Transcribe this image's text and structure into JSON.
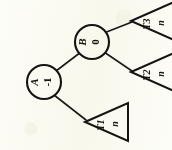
{
  "diagram": {
    "orientation": "rotated-90-ccw",
    "background_color": "#fdfdf8",
    "ink_color": "#141412",
    "nodes": [
      {
        "id": "A",
        "label": "A",
        "balance": "-1",
        "x": 44,
        "y": 82,
        "r": 17
      },
      {
        "id": "B",
        "label": "B",
        "balance": "0",
        "x": 92,
        "y": 42,
        "r": 17
      }
    ],
    "subtrees": [
      {
        "id": "T1",
        "label": "T1",
        "height": "n",
        "apex_x": 85,
        "apex_y": 122,
        "base_x": 128,
        "base_top": 103,
        "base_bottom": 141
      },
      {
        "id": "T2",
        "label": "T2",
        "height": "n",
        "apex_x": 131,
        "apex_y": 72,
        "base_x": 174,
        "base_top": 53,
        "base_bottom": 91
      },
      {
        "id": "T3",
        "label": "T3",
        "height": "n",
        "apex_x": 131,
        "apex_y": 21,
        "base_x": 174,
        "base_top": 2,
        "base_bottom": 40
      }
    ],
    "edges": [
      {
        "from": "A",
        "to": "B",
        "x1": 56,
        "y1": 71,
        "x2": 81,
        "y2": 52
      },
      {
        "from": "A",
        "to": "T1",
        "x1": 54,
        "y1": 95,
        "x2": 86,
        "y2": 120
      },
      {
        "from": "B",
        "to": "T2",
        "x1": 104,
        "y1": 52,
        "x2": 132,
        "y2": 71
      },
      {
        "from": "B",
        "to": "T3",
        "x1": 104,
        "y1": 33,
        "x2": 132,
        "y2": 22
      }
    ]
  }
}
